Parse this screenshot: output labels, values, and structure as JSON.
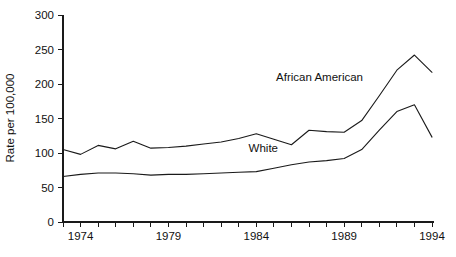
{
  "chart_data": {
    "type": "line",
    "title": "",
    "xlabel": "",
    "ylabel": "Rate per 100,000",
    "xlim": [
      1973,
      1994
    ],
    "ylim": [
      0,
      300
    ],
    "grid": false,
    "legend_position": "inline-annotation",
    "y_ticks": [
      0,
      50,
      100,
      150,
      200,
      250,
      300
    ],
    "y_tick_labels": [
      "0",
      "50",
      "100",
      "150",
      "200",
      "250",
      "300"
    ],
    "x_ticks": [
      1973,
      1974,
      1975,
      1976,
      1977,
      1978,
      1979,
      1980,
      1981,
      1982,
      1983,
      1984,
      1985,
      1986,
      1987,
      1988,
      1989,
      1990,
      1991,
      1992,
      1993,
      1994
    ],
    "x_labeled_ticks": [
      1974,
      1979,
      1984,
      1989,
      1994
    ],
    "x_tick_labels": [
      "1974",
      "1979",
      "1984",
      "1989",
      "1994"
    ],
    "x": [
      1973,
      1974,
      1975,
      1976,
      1977,
      1978,
      1979,
      1980,
      1981,
      1982,
      1983,
      1984,
      1985,
      1986,
      1987,
      1988,
      1989,
      1990,
      1991,
      1992,
      1993,
      1994
    ],
    "series": [
      {
        "name": "African American",
        "label": "African American",
        "values": [
          105,
          98,
          111,
          106,
          117,
          107,
          108,
          110,
          113,
          116,
          121,
          128,
          120,
          112,
          133,
          131,
          130,
          147,
          183,
          220,
          242,
          217
        ]
      },
      {
        "name": "White",
        "label": "White",
        "values": [
          66,
          69,
          71,
          71,
          70,
          68,
          69,
          69,
          70,
          71,
          72,
          73,
          78,
          83,
          87,
          89,
          92,
          105,
          133,
          160,
          170,
          123
        ]
      }
    ],
    "annotations": [
      {
        "text": "African American",
        "x": 1987.6,
        "y": 205
      },
      {
        "text": "White",
        "x": 1984.4,
        "y": 101
      }
    ]
  },
  "axis": {
    "y_title": "Rate per 100,000"
  },
  "caption": {
    "text": ""
  }
}
